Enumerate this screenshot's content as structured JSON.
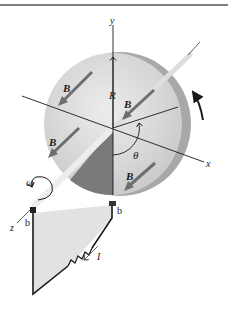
{
  "diagram": {
    "labels": {
      "y_axis": "y",
      "x_axis": "x",
      "z_axis": "z",
      "radius": "R",
      "angle": "θ",
      "angular_velocity": "ω",
      "current": "I",
      "field": "B",
      "brush_top": "b",
      "brush_bottom": "b"
    },
    "field_arrows": [
      {
        "label": "B",
        "position": "upper-left"
      },
      {
        "label": "B",
        "position": "upper-right"
      },
      {
        "label": "B",
        "position": "lower-left"
      },
      {
        "label": "B",
        "position": "lower-right"
      }
    ],
    "colors": {
      "disk_face": "#d4d4d4",
      "disk_rim": "#a8a8a8",
      "shaded_sector": "#7a7a7a",
      "field_arrow": "#6e6e6e",
      "circuit_fill": "#e2e2e2",
      "line": "#1a1a1a"
    }
  }
}
